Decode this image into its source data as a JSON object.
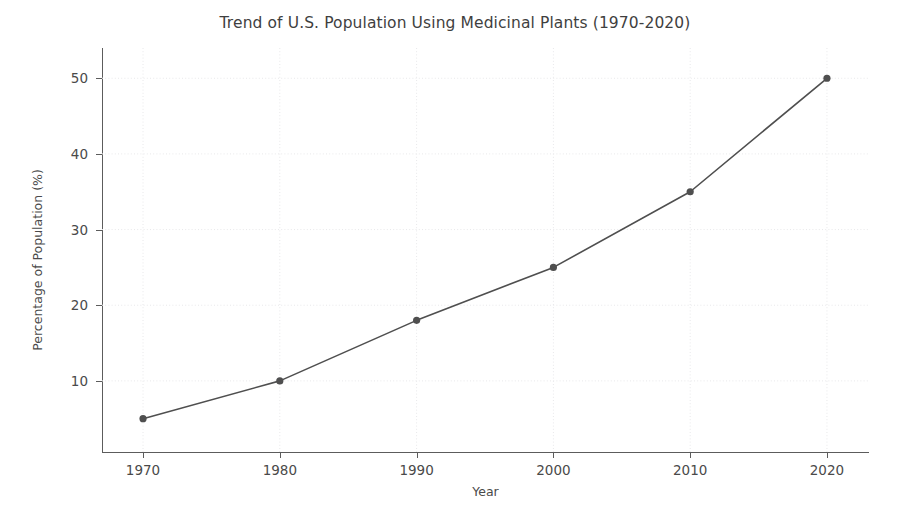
{
  "chart_data": {
    "type": "line",
    "title": "Trend of U.S. Population Using Medicinal Plants (1970-2020)",
    "xlabel": "Year",
    "ylabel": "Percentage of Population (%)",
    "x": [
      1970,
      1980,
      1990,
      2000,
      2010,
      2020
    ],
    "categories": [
      "1970",
      "1980",
      "1990",
      "2000",
      "2010",
      "2020"
    ],
    "values": [
      5,
      10,
      18,
      25,
      35,
      50
    ],
    "series": [
      {
        "name": "Percentage of Population (%)",
        "values": [
          5,
          10,
          18,
          25,
          35,
          50
        ]
      }
    ],
    "xlim": [
      1967,
      1022.8
    ],
    "x_range": [
      1967.0,
      2023.0
    ],
    "ylim": [
      0.6,
      54.0
    ],
    "ytick_labels": [
      "10",
      "20",
      "30",
      "40",
      "50"
    ],
    "yticks": [
      10,
      20,
      30,
      40,
      50
    ],
    "xtick_labels": [
      "1970",
      "1980",
      "1990",
      "2000",
      "2010",
      "2020"
    ],
    "xticks": [
      1970,
      1980,
      1990,
      2000,
      2010,
      2020
    ],
    "grid": true,
    "grid_style": "dotted",
    "legend": false,
    "legend_position": "none",
    "marker": "circle",
    "line_color": "#4f4f4f",
    "marker_color": "#4f4f4f",
    "grid_color": "#e8e8ea",
    "background_color": "#ffffff",
    "axis_color": "#5c5c5c"
  }
}
